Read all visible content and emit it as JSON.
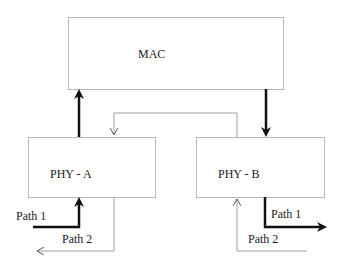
{
  "diagram": {
    "blocks": {
      "mac": {
        "label": "MAC"
      },
      "phy_a": {
        "label": "PHY - A"
      },
      "phy_b": {
        "label": "PHY - B"
      }
    },
    "paths": {
      "phy_a_path1": "Path 1",
      "phy_a_path2": "Path 2",
      "phy_b_path1": "Path 1",
      "phy_b_path2": "Path 2"
    },
    "colors": {
      "box_border": "#b8b8b8",
      "thick_arrow": "#111111",
      "thin_arrow": "#a0a0a0"
    }
  }
}
